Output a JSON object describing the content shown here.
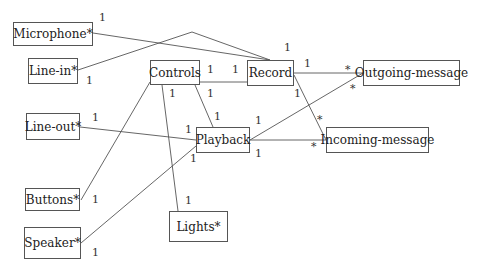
{
  "diagram": {
    "type": "class-association-diagram",
    "nodes": [
      {
        "id": "microphone",
        "label": "Microphone*",
        "x": 13,
        "y": 22,
        "w": 80,
        "h": 24
      },
      {
        "id": "line-in",
        "label": "Line-in*",
        "x": 28,
        "y": 58,
        "w": 50,
        "h": 26
      },
      {
        "id": "controls",
        "label": "Controls",
        "x": 150,
        "y": 60,
        "w": 50,
        "h": 25
      },
      {
        "id": "record",
        "label": "Record",
        "x": 247,
        "y": 60,
        "w": 47,
        "h": 26
      },
      {
        "id": "outgoing-message",
        "label": "Outgoing-message",
        "x": 363,
        "y": 60,
        "w": 97,
        "h": 26
      },
      {
        "id": "line-out",
        "label": "Line-out*",
        "x": 26,
        "y": 113,
        "w": 54,
        "h": 27
      },
      {
        "id": "playback",
        "label": "Playback",
        "x": 196,
        "y": 127,
        "w": 54,
        "h": 26
      },
      {
        "id": "incoming-message",
        "label": "Incoming-message",
        "x": 326,
        "y": 127,
        "w": 103,
        "h": 26
      },
      {
        "id": "buttons",
        "label": "Buttons*",
        "x": 25,
        "y": 188,
        "w": 55,
        "h": 23
      },
      {
        "id": "speaker",
        "label": "Speaker*",
        "x": 24,
        "y": 227,
        "w": 57,
        "h": 32
      },
      {
        "id": "lights",
        "label": "Lights*",
        "x": 169,
        "y": 211,
        "w": 59,
        "h": 31
      }
    ],
    "edges": [
      {
        "from": "microphone",
        "to": "record",
        "points": "93,33 270,60"
      },
      {
        "from": "line-in",
        "to": "record",
        "points": "78,70 192,32 270,60"
      },
      {
        "from": "controls",
        "to": "record",
        "points": "200,82 247,82"
      },
      {
        "from": "controls",
        "to": "playback",
        "points": "195,85 213,127"
      },
      {
        "from": "controls",
        "to": "lights",
        "points": "162,85 178,211"
      },
      {
        "from": "controls",
        "to": "buttons",
        "points": "150,82 81,200"
      },
      {
        "from": "line-out",
        "to": "playback",
        "points": "80,127 196,140"
      },
      {
        "from": "speaker",
        "to": "playback",
        "points": "81,243 196,146"
      },
      {
        "from": "record",
        "to": "outgoing-message",
        "points": "294,73 363,73"
      },
      {
        "from": "record",
        "to": "incoming-message",
        "points": "294,75 326,140"
      },
      {
        "from": "playback",
        "to": "outgoing-message",
        "points": "250,140 363,73"
      },
      {
        "from": "playback",
        "to": "incoming-message",
        "points": "250,140 326,140"
      }
    ],
    "multiplicities": [
      {
        "text": "1",
        "x": 99,
        "y": 12
      },
      {
        "text": "1",
        "x": 86,
        "y": 75
      },
      {
        "text": "1",
        "x": 284,
        "y": 42
      },
      {
        "text": "1",
        "x": 207,
        "y": 64
      },
      {
        "text": "1",
        "x": 232,
        "y": 64
      },
      {
        "text": "1",
        "x": 169,
        "y": 88
      },
      {
        "text": "1",
        "x": 207,
        "y": 88
      },
      {
        "text": "1",
        "x": 214,
        "y": 111
      },
      {
        "text": "1",
        "x": 92,
        "y": 112
      },
      {
        "text": "1",
        "x": 185,
        "y": 124
      },
      {
        "text": "1",
        "x": 190,
        "y": 153
      },
      {
        "text": "1",
        "x": 92,
        "y": 194
      },
      {
        "text": "1",
        "x": 92,
        "y": 247
      },
      {
        "text": "1",
        "x": 185,
        "y": 195
      },
      {
        "text": "1",
        "x": 304,
        "y": 58
      },
      {
        "text": "1",
        "x": 294,
        "y": 88
      },
      {
        "text": "1",
        "x": 255,
        "y": 115
      },
      {
        "text": "1",
        "x": 255,
        "y": 148
      },
      {
        "text": "*",
        "x": 345,
        "y": 64
      },
      {
        "text": "*",
        "x": 350,
        "y": 83
      },
      {
        "text": "*",
        "x": 317,
        "y": 114
      },
      {
        "text": "*",
        "x": 311,
        "y": 141
      }
    ]
  }
}
